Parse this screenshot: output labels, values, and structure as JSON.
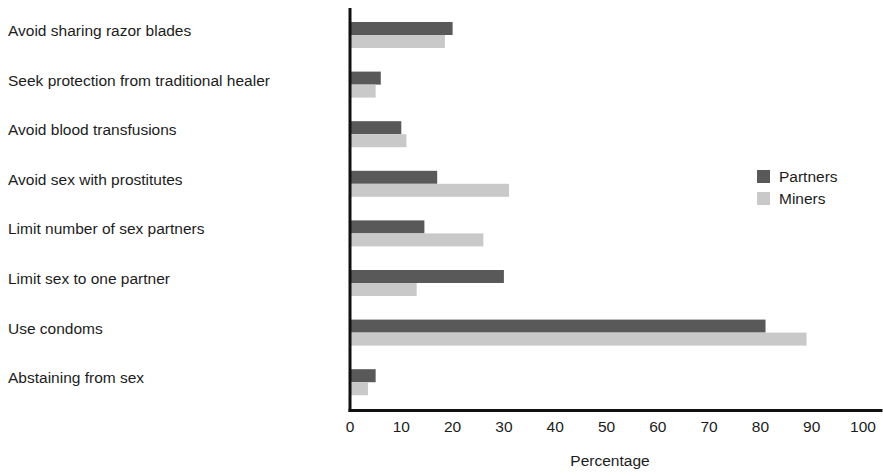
{
  "chart_data": {
    "type": "bar",
    "orientation": "horizontal",
    "title": "",
    "xlabel": "Percentage",
    "ylabel": "",
    "xlim": [
      0,
      100
    ],
    "xticks": [
      0,
      10,
      20,
      30,
      40,
      50,
      60,
      70,
      80,
      90,
      100
    ],
    "xtick_labels": [
      "0",
      "10",
      "20",
      "30",
      "40",
      "50",
      "60",
      "70",
      "80",
      "90",
      "100"
    ],
    "grid": false,
    "legend_position": "right",
    "categories": [
      "Avoid sharing razor blades",
      "Seek protection from traditional healer",
      "Avoid blood transfusions",
      "Avoid sex with prostitutes",
      "Limit number of sex partners",
      "Limit sex to one partner",
      "Use condoms",
      "Abstaining from sex"
    ],
    "series": [
      {
        "name": "Partners",
        "color": "#595959",
        "values": [
          20,
          6,
          10,
          17,
          14.5,
          30,
          81,
          5
        ]
      },
      {
        "name": "Miners",
        "color": "#c9c9c9",
        "values": [
          18.5,
          5,
          11,
          31,
          26,
          13,
          89,
          3.5
        ]
      }
    ]
  },
  "legend": {
    "items": [
      {
        "label": "Partners",
        "swatch": "#595959"
      },
      {
        "label": "Miners",
        "swatch": "#c9c9c9"
      }
    ]
  },
  "axis": {
    "x_title": "Percentage"
  },
  "colors": {
    "axis_line": "#111111",
    "text": "#1c1c1c",
    "background": "#ffffff",
    "partners": "#595959",
    "miners": "#c9c9c9"
  }
}
